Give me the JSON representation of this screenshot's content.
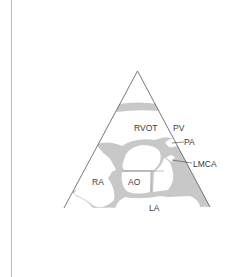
{
  "diagram": {
    "type": "echocardiography parasternal short-axis sector schematic",
    "labels": {
      "rvot": "RVOT",
      "pv": "PV",
      "pa": "PA",
      "lmca": "LMCA",
      "ra": "RA",
      "ao": "AO",
      "la": "LA"
    },
    "colors": {
      "tissue": "#c8c8c8",
      "outline": "#555555",
      "chamber": "#ffffff",
      "text": "#3a3a3a"
    }
  }
}
